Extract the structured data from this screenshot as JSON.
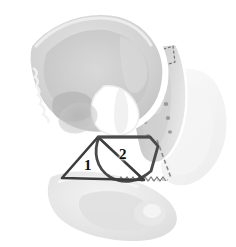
{
  "figure": {
    "view": "right anterior oblique",
    "background_color": "#ffffff"
  },
  "annotations": {
    "regions": [
      {
        "id": "region-1",
        "label": "1",
        "shape": "triangle",
        "label_x": 84,
        "label_y": 158,
        "stroke_color": "#3d3d3d",
        "stroke_width": 2.6,
        "points": "98,137 62,178 144,180"
      },
      {
        "id": "region-2",
        "label": "2",
        "shape": "curved-quadrilateral",
        "label_x": 119,
        "label_y": 147,
        "stroke_color": "#4a4a4a",
        "stroke_width": 2.8,
        "path": "M99,137 C93,152 96,168 110,177 C124,185 140,181 151,171 L158,146 L150,137 Z"
      }
    ],
    "dashed_lines": [
      {
        "id": "dashed-sacral-box",
        "description": "dashed outline at sacral promontory",
        "color": "#6f6f6f",
        "dash": "3,2"
      },
      {
        "id": "dashed-diagonal-right",
        "description": "dashed diagonal toward ischial spine",
        "color": "#8a8a8a",
        "dash": "4,3"
      },
      {
        "id": "zigzag-pubic-line",
        "description": "sawtooth line along inferior pubic ramus",
        "color": "#7a7a7a"
      }
    ]
  },
  "bone_structures": [
    {
      "name": "ilium-near",
      "tone": "#d9d9d9"
    },
    {
      "name": "iliac-fossa",
      "tone": "#c9c9c9"
    },
    {
      "name": "sacrum",
      "tone": "#c4c4c4"
    },
    {
      "name": "acetabulum",
      "tone": "#b8b8b8"
    },
    {
      "name": "obturator-foramen",
      "tone": "#ffffff"
    },
    {
      "name": "pubis",
      "tone": "#ececec"
    },
    {
      "name": "ischium",
      "tone": "#e2e2e2"
    },
    {
      "name": "ilium-far",
      "tone": "#f7f7f7"
    }
  ],
  "palette": {
    "outline": "#ffffff",
    "bone_light": "#efefef",
    "bone_mid": "#d4d4d4",
    "bone_dark": "#bdbdbd",
    "shadow": "#a9a9a9",
    "mark_dark": "#3d3d3d",
    "dash_gray": "#808080",
    "label_text": "#111111"
  }
}
